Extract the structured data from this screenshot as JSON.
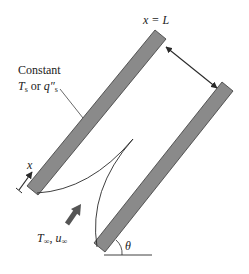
{
  "diagram": {
    "labels": {
      "x_eq_L": "x = L",
      "constant": "Constant",
      "ts": "T",
      "ts_sub": "s",
      "or": " or ",
      "qs": "q″",
      "qs_sub": "s",
      "x_axis": "x",
      "t_inf": "T",
      "inf_sub": "∞",
      "comma": ", ",
      "u_inf": "u",
      "theta": "θ"
    },
    "colors": {
      "plate_fill": "#8a8a8a",
      "plate_stroke": "#3a3a3a",
      "line": "#2a2a2a",
      "flow_arrow": "#555555"
    },
    "elements": [
      "left-plate",
      "right-plate",
      "plate-spacing-double-arrow",
      "boundary-layer-curves",
      "flow-direction-arrow",
      "x-coordinate-arrow",
      "inclination-angle-theta",
      "horizontal-reference-line"
    ]
  }
}
